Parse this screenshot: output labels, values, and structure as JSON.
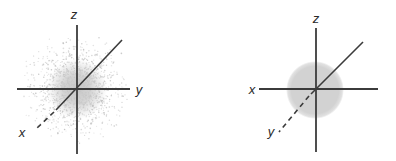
{
  "figure": {
    "background": "#ffffff",
    "line_color": "#3b3b3b",
    "label_color": "#2a2a2a",
    "diagrams": [
      {
        "id": "dot-density",
        "axis_labels": {
          "vertical": "z",
          "horizontal": "y",
          "diagonal": "x"
        },
        "cloud": {
          "type": "stipple",
          "center_x": 77,
          "center_y": 89,
          "sigma": 21,
          "max_radius": 58,
          "dot_count": 1300,
          "dot_color": "#b9b9b9",
          "core_color": "#c8c8c8",
          "seed": 1234
        }
      },
      {
        "id": "boundary-surface",
        "axis_labels": {
          "vertical": "z",
          "horizontal": "x",
          "diagonal": "y"
        },
        "sphere": {
          "center_x": 315,
          "center_y": 90,
          "radius": 27,
          "fill": "#d2d2d2"
        }
      }
    ]
  }
}
